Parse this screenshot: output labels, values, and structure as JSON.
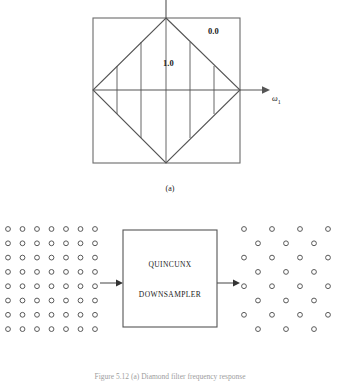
{
  "figure": {
    "caption": "Figure 5.12 (a) Diamond filter frequency response",
    "subcaption_a": "(a)",
    "subcaption_b": "(b)"
  },
  "panel_a": {
    "passband_label": "1.0",
    "stopband_label": "0.0",
    "axis_label": "ω",
    "axis_subscript": "1",
    "line_color": "#555555",
    "square": {
      "x": 93,
      "y": 18,
      "width": 147,
      "height": 145
    },
    "diamond": {
      "top": [
        166,
        18
      ],
      "right": [
        240,
        90
      ],
      "bottom": [
        166,
        163
      ],
      "left": [
        93,
        90
      ]
    },
    "hatch_x": [
      117,
      141,
      166,
      190,
      214
    ],
    "axis": {
      "y": 90,
      "x_start": 93,
      "x_end": 268,
      "arrow": true
    },
    "vertical_axis": {
      "x": 166,
      "y_top": 0,
      "y_bottom": 18
    }
  },
  "panel_b": {
    "input_grid": {
      "name": "rectangular-sampling-grid",
      "cols": 7,
      "rows": 8,
      "x0": 8,
      "y0": 24,
      "dx": 14.5,
      "dy": 14.3,
      "radius": 2.4
    },
    "output_grid": {
      "name": "quincunx-sampling-grid",
      "cols": 4,
      "rows": 8,
      "x0": 244,
      "y0": 24,
      "dx": 28,
      "dy": 14.3,
      "offset": 14,
      "radius": 2.4
    },
    "block": {
      "x": 123,
      "y": 25,
      "width": 94,
      "height": 97,
      "line1": "QUINCUNX",
      "line2": "DOWNSAMPLER"
    },
    "arrow_in": {
      "x_start": 100,
      "x_end": 123,
      "y": 78
    },
    "arrow_out": {
      "x_start": 217,
      "x_end": 240,
      "y": 78
    },
    "marker_color": "#5a5a5a"
  }
}
